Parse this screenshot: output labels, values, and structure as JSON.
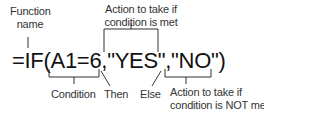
{
  "formula": "=IF(A1=6,\"YES\",\"NO\")",
  "labels": {
    "function_name_line1": "Function",
    "function_name_line2": "name",
    "action_met_line1": "Action to take if",
    "action_met_line2": "condition is met",
    "condition": "Condition",
    "then": "Then",
    "else": "Else",
    "action_not_met_line1": "Action to take if",
    "action_not_met_line2": "condition is NOT met"
  },
  "colors": {
    "text": "#111111",
    "label": "#333333",
    "line": "#333333"
  }
}
